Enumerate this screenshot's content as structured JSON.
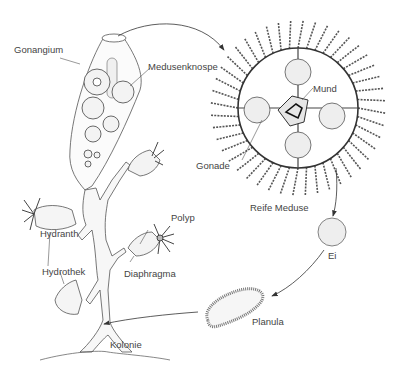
{
  "diagram": {
    "labels": {
      "gonangium": "Gonangium",
      "medusenknospe": "Medusenknospe",
      "mund": "Mund",
      "gonade": "Gonade",
      "reife_meduse": "Reife Meduse",
      "ei": "Ei",
      "planula": "Planula",
      "polyp": "Polyp",
      "hydranth": "Hydranth",
      "diaphragma": "Diaphragma",
      "hydrothek": "Hydrothek",
      "kolonie": "Kolonie"
    },
    "colors": {
      "line": "#444444",
      "fill": "#f2f2f2",
      "text": "#444444"
    }
  }
}
